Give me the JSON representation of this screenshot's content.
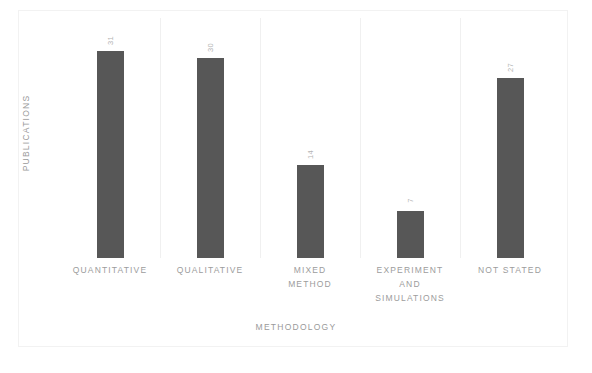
{
  "chart_data": {
    "type": "bar",
    "title": "",
    "categories": [
      "QUANTITATIVE",
      "QUALITATIVE",
      "MIXED METHOD",
      "EXPERIMENT AND SIMULATIONS",
      "NOT STATED"
    ],
    "category_lines": [
      [
        "QUANTITATIVE"
      ],
      [
        "QUALITATIVE"
      ],
      [
        "MIXED",
        "METHOD"
      ],
      [
        "EXPERIMENT",
        "AND",
        "SIMULATIONS"
      ],
      [
        "NOT STATED"
      ]
    ],
    "values": [
      31,
      30,
      14,
      7,
      27
    ],
    "value_labels": [
      "31",
      "30",
      "14",
      "7",
      "27"
    ],
    "xlabel": "METHODOLOGY",
    "ylabel": "PUBLICATIONS",
    "ylim": [
      0,
      36
    ],
    "grid": "vertical-category-separators",
    "legend": "none",
    "bar_color": "#575757",
    "label_color": "#b4b4b4",
    "axis_text_color": "#9a9a9a",
    "background_color": "#ffffff",
    "frame_color": "#f2f2f2"
  }
}
